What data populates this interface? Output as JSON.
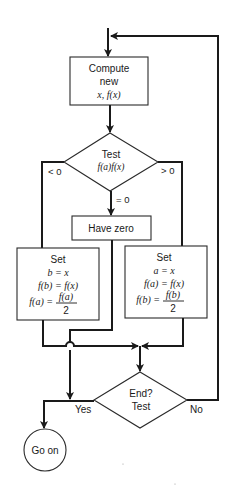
{
  "flowchart": {
    "compute_box": {
      "line1": "Compute",
      "line2": "new",
      "line3": "x, f(x)"
    },
    "test_diamond": {
      "line1": "Test",
      "line2": "f(a)f(x)"
    },
    "branch_labels": {
      "less": "< 0",
      "greater": "> 0",
      "equal": "= 0"
    },
    "have_zero_box": {
      "label": "Have zero"
    },
    "set_left_box": {
      "title": "Set",
      "line1": "b = x",
      "line2": "f(b) = f(x)",
      "line3_lhs": "f(a) =",
      "line3_num": "f(a)",
      "line3_den": "2"
    },
    "set_right_box": {
      "title": "Set",
      "line1": "a = x",
      "line2": "f(a) = f(x)",
      "line3_lhs": "f(b) =",
      "line3_num": "f(b)",
      "line3_den": "2"
    },
    "end_diamond": {
      "line1": "End?",
      "line2": "Test"
    },
    "end_labels": {
      "yes": "Yes",
      "no": "No"
    },
    "terminal": {
      "label": "Go on"
    }
  }
}
